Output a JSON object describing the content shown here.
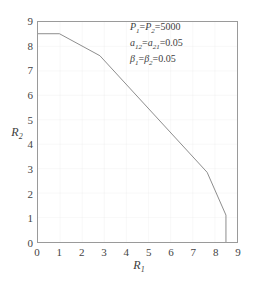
{
  "chart_data": {
    "type": "line",
    "title": "",
    "subtitle": "",
    "xlabel": "R_1",
    "ylabel": "R_2",
    "xlim": [
      0,
      9
    ],
    "ylim": [
      0,
      9
    ],
    "xticks": [
      "0",
      "1",
      "2",
      "3",
      "4",
      "5",
      "6",
      "7",
      "8",
      "9"
    ],
    "yticks": [
      "0",
      "1",
      "2",
      "3",
      "4",
      "5",
      "6",
      "7",
      "8",
      "9"
    ],
    "xtick_values": [
      0,
      1,
      2,
      3,
      4,
      5,
      6,
      7,
      8,
      9
    ],
    "ytick_values": [
      0,
      1,
      2,
      3,
      4,
      5,
      6,
      7,
      8,
      9
    ],
    "grid": true,
    "legend": false,
    "legend_position": "none",
    "line_color": "#808080",
    "grid_color": "#e2e2e2",
    "axis_color": "#9a9a9a",
    "background_color": "#ffffff",
    "series": [
      {
        "name": "capacity-region-boundary",
        "points": [
          [
            0.0,
            8.52
          ],
          [
            0.97,
            8.52
          ],
          [
            2.8,
            7.62
          ],
          [
            7.65,
            2.85
          ],
          [
            8.5,
            1.1
          ],
          [
            8.5,
            0.0
          ]
        ]
      }
    ],
    "annotations": [
      {
        "id": "power",
        "text": "P_1=P_2=5000"
      },
      {
        "id": "cross-gain",
        "text": "a_12=a_21=0.05"
      },
      {
        "id": "beta",
        "text": "beta_1=beta_2=0.05"
      }
    ]
  },
  "axes": {
    "xlabel_base": "R",
    "xlabel_sub": "1",
    "ylabel_base": "R",
    "ylabel_sub": "2"
  },
  "annotation_lines": {
    "line1": {
      "p_symbol": "P",
      "p1_sub": "1",
      "eq1": "=",
      "p2_symbol": "P",
      "p2_sub": "2",
      "eq2": "=",
      "value": "5000"
    },
    "line2": {
      "a_symbol": "a",
      "a1_sub": "12",
      "eq1": "=",
      "a2_symbol": "a",
      "a2_sub": "21",
      "eq2": "=",
      "value": "0.05"
    },
    "line3": {
      "b_symbol": "β",
      "b1_sub": "1",
      "eq1": "=",
      "b2_symbol": "β",
      "b2_sub": "2",
      "eq2": "=",
      "value": "0.05"
    }
  }
}
